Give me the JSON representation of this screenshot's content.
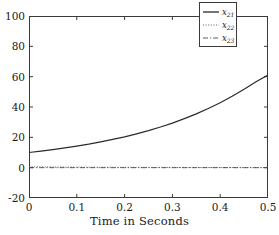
{
  "chart_data": {
    "type": "line",
    "title": "",
    "xlabel": "Time in Seconds",
    "ylabel": "",
    "xlim": [
      0,
      0.5
    ],
    "ylim": [
      -20,
      100
    ],
    "xticks": [
      "0",
      "0.1",
      "0.2",
      "0.3",
      "0.4",
      "0.5"
    ],
    "xtick_values": [
      0,
      0.1,
      0.2,
      0.3,
      0.4,
      0.5
    ],
    "yticks": [
      "100",
      "80",
      "60",
      "40",
      "20",
      "0",
      "-20"
    ],
    "ytick_values": [
      100,
      80,
      60,
      40,
      20,
      0,
      -20
    ],
    "grid": false,
    "legend_position": "top-right",
    "x": [
      0,
      0.025,
      0.05,
      0.075,
      0.1,
      0.125,
      0.15,
      0.175,
      0.2,
      0.225,
      0.25,
      0.275,
      0.3,
      0.325,
      0.35,
      0.375,
      0.4,
      0.425,
      0.45,
      0.475,
      0.5
    ],
    "series": [
      {
        "name": "x21",
        "label_base": "x",
        "label_sub": "21",
        "style": "solid",
        "color": "#2b2b2b",
        "values": [
          10.0,
          10.9,
          11.9,
          13.0,
          14.2,
          15.5,
          17.0,
          18.6,
          20.3,
          22.3,
          24.4,
          26.8,
          29.4,
          32.3,
          35.5,
          39.0,
          42.8,
          47.1,
          51.7,
          56.7,
          61.0
        ]
      },
      {
        "name": "x22",
        "label_base": "x",
        "label_sub": "22",
        "style": "dotted",
        "color": "#4a4a4a",
        "values": [
          0.6,
          0.5,
          0.45,
          0.4,
          0.35,
          0.3,
          0.28,
          0.25,
          0.22,
          0.2,
          0.18,
          0.16,
          0.15,
          0.13,
          0.12,
          0.11,
          0.1,
          0.09,
          0.08,
          0.07,
          0.06
        ]
      },
      {
        "name": "x23",
        "label_base": "x",
        "label_sub": "23",
        "style": "dashdot",
        "color": "#4a4a4a",
        "values": [
          0.0,
          0.0,
          0.0,
          0.0,
          0.0,
          0.0,
          0.0,
          0.0,
          0.0,
          0.0,
          0.0,
          0.0,
          0.0,
          0.0,
          0.0,
          0.0,
          0.0,
          0.0,
          0.0,
          0.0,
          0.0
        ]
      }
    ]
  },
  "legend": {
    "entries": [
      {
        "text": "x",
        "sub": "21"
      },
      {
        "text": "x",
        "sub": "22"
      },
      {
        "text": "x",
        "sub": "23"
      }
    ]
  },
  "axes": {
    "xlabel": "Time in Seconds"
  }
}
